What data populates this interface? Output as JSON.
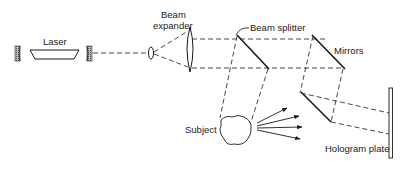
{
  "diagram": {
    "labels": {
      "laser": "Laser",
      "beam_expander_line1": "Beam",
      "beam_expander_line2": "expander",
      "beam_splitter": "Beam splitter",
      "mirrors": "Mirrors",
      "subject": "Subject",
      "hologram_plate": "Hologram plate"
    },
    "components": [
      {
        "id": "laser-cavity-mirror-left",
        "type": "mirror"
      },
      {
        "id": "laser-body",
        "type": "laser"
      },
      {
        "id": "laser-cavity-mirror-right",
        "type": "mirror"
      },
      {
        "id": "small-lens",
        "type": "lens"
      },
      {
        "id": "large-lens",
        "type": "lens"
      },
      {
        "id": "beam-splitter",
        "type": "beam-splitter"
      },
      {
        "id": "mirror-upper",
        "type": "mirror"
      },
      {
        "id": "mirror-lower",
        "type": "mirror"
      },
      {
        "id": "subject",
        "type": "object"
      },
      {
        "id": "hologram-plate",
        "type": "plate"
      }
    ],
    "colors": {
      "line": "#1a1a1a",
      "mirror_fill": "#9a9a9a",
      "background": "#ffffff"
    }
  }
}
